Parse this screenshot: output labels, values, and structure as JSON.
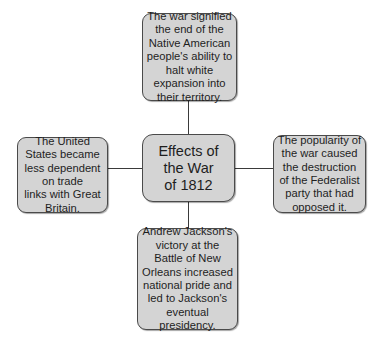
{
  "diagram": {
    "type": "concept-map",
    "center": {
      "text": "Effects of\nthe War\nof 1812"
    },
    "nodes": {
      "top": {
        "text": "The war signified\nthe end of the\nNative American\npeople's ability to\nhalt white\nexpansion into\ntheir territory."
      },
      "left": {
        "text": "The United\nStates became\nless dependent\non trade\nlinks with Great\nBritain."
      },
      "right": {
        "text": "The popularity of\nthe war caused\nthe destruction\nof the Federalist\nparty that had\nopposed it."
      },
      "bottom": {
        "text": "Andrew Jackson's\nvictory at the\nBattle of New\nOrleans increased\nnational pride and\nled to Jackson's\neventual\npresidency."
      }
    },
    "colors": {
      "box_fill": "#d4d4d4",
      "box_border": "#4a4a4a",
      "line": "#3a3a3a",
      "text": "#1e1e1e",
      "background": "#ffffff"
    }
  }
}
